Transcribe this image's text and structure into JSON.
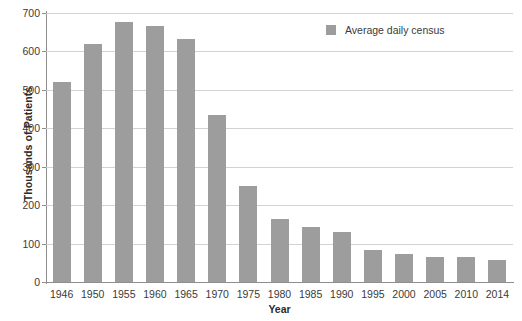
{
  "chart_data": {
    "type": "bar",
    "title": "",
    "xlabel": "Year",
    "ylabel": "Thousands of Patients",
    "categories": [
      "1946",
      "1950",
      "1955",
      "1960",
      "1965",
      "1970",
      "1975",
      "1980",
      "1985",
      "1990",
      "1995",
      "2000",
      "2005",
      "2010",
      "2014"
    ],
    "values": [
      520,
      620,
      677,
      665,
      632,
      434,
      249,
      163,
      142,
      130,
      84,
      72,
      64,
      66,
      56
    ],
    "series": [
      {
        "name": "Average daily census",
        "values": [
          520,
          620,
          677,
          665,
          632,
          434,
          249,
          163,
          142,
          130,
          84,
          72,
          64,
          66,
          56
        ]
      }
    ],
    "ylim": [
      0,
      700
    ],
    "yticks": [
      0,
      100,
      200,
      300,
      400,
      500,
      600,
      700
    ],
    "ytick_labels": [
      "0",
      "100",
      "200",
      "300",
      "400",
      "500",
      "600",
      "700"
    ],
    "grid": true,
    "legend": {
      "position": "top-right",
      "entries": [
        {
          "label": "Average daily census",
          "color": "#9d9d9d"
        }
      ]
    },
    "colors": {
      "bar": "#9d9d9d",
      "gridline": "#d2d2d2",
      "axis": "#8e8e8e",
      "text": "#3a3a3a",
      "background": "#ffffff"
    }
  }
}
